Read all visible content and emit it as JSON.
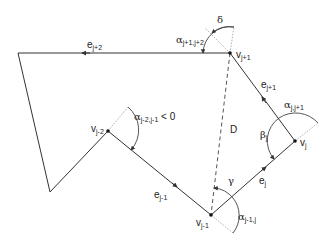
{
  "diagram": {
    "type": "polygon-geometry",
    "colors": {
      "line": "#333333",
      "dotted": "#888888",
      "background": "#ffffff"
    },
    "vertices": {
      "v_j_plus_1": {
        "label_base": "v",
        "label_sub": "j+1",
        "x": 230,
        "y": 53
      },
      "v_j": {
        "label_base": "v",
        "label_sub": "j",
        "x": 295,
        "y": 141
      },
      "v_j_minus_1": {
        "label_base": "v",
        "label_sub": "j-1",
        "x": 211,
        "y": 215
      },
      "v_j_minus_2": {
        "label_base": "v",
        "label_sub": "j-2",
        "x": 108,
        "y": 131
      },
      "corner_top_left": {
        "x": 18,
        "y": 53
      },
      "corner_bottom_left": {
        "x": 50,
        "y": 192
      }
    },
    "edges": {
      "e_j_plus_2": {
        "base": "e",
        "sub": "j+2"
      },
      "e_j_plus_1": {
        "base": "e",
        "sub": "j+1"
      },
      "e_j": {
        "base": "e",
        "sub": "j"
      },
      "e_j_minus_1": {
        "base": "e",
        "sub": "j-1"
      }
    },
    "angles": {
      "alpha_j1_j2": {
        "base": "α",
        "sub": "j+1,j+2"
      },
      "delta": {
        "base": "δ"
      },
      "alpha_j_j1": {
        "base": "α",
        "sub": "j,j+1"
      },
      "beta_j": {
        "base": "β",
        "sub": "j"
      },
      "gamma": {
        "base": "γ"
      },
      "alpha_j1_j": {
        "base": "α",
        "sub": "j-1,j"
      },
      "alpha_j2_j1": {
        "base": "α",
        "sub": "j-2,j-1",
        "suffix": " < 0"
      }
    },
    "diagonal": {
      "label": "D"
    }
  }
}
